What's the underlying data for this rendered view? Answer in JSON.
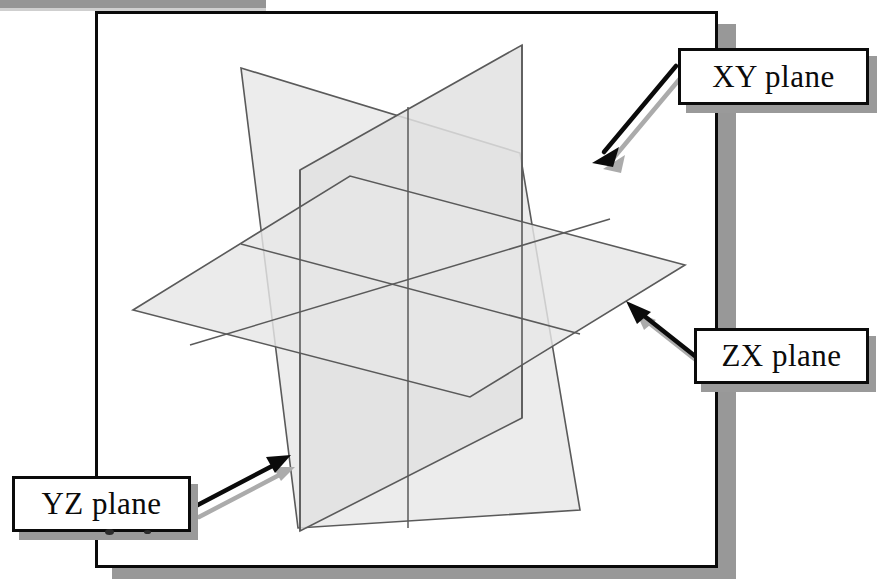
{
  "figure": {
    "background_color": "#ffffff",
    "frame_border_color": "#0a0a0a",
    "frame_shadow_color": "#989898",
    "plane_fill_light": "#ededed",
    "plane_fill_mid": "#e2e2e2",
    "plane_fill_dark": "#d8d8d8",
    "plane_edge_color": "#5a5a5a",
    "arrow_color": "#0b0b0b",
    "arrow_shadow_color": "#a8a8a8"
  },
  "labels": {
    "xy": "XY plane",
    "zx": "ZX plane",
    "yz": "YZ plane"
  },
  "chart_data": {
    "type": "diagram",
    "origin": {
      "x": 408,
      "y": 287
    },
    "planes": [
      {
        "name": "YZ plane",
        "orientation": "vertical-left-facing",
        "fill": "#e9e9e9",
        "corners": [
          {
            "x": 241,
            "y": 68
          },
          {
            "x": 520,
            "y": 153
          },
          {
            "x": 580,
            "y": 510
          },
          {
            "x": 298,
            "y": 528
          }
        ]
      },
      {
        "name": "XY plane",
        "orientation": "vertical-right-facing",
        "fill": "#e4e4e4",
        "corners": [
          {
            "x": 300,
            "y": 170
          },
          {
            "x": 522,
            "y": 45
          },
          {
            "x": 522,
            "y": 418
          },
          {
            "x": 300,
            "y": 531
          }
        ]
      },
      {
        "name": "ZX plane",
        "orientation": "horizontal",
        "fill": "#e6e6e6",
        "corners": [
          {
            "x": 133,
            "y": 310
          },
          {
            "x": 350,
            "y": 176
          },
          {
            "x": 685,
            "y": 265
          },
          {
            "x": 470,
            "y": 397
          }
        ]
      }
    ],
    "annotations": [
      {
        "label": "XY plane",
        "arrow_from": {
          "x": 672,
          "y": 70
        },
        "arrow_to": {
          "x": 592,
          "y": 155
        }
      },
      {
        "label": "ZX plane",
        "arrow_from": {
          "x": 700,
          "y": 360
        },
        "arrow_to": {
          "x": 628,
          "y": 303
        }
      },
      {
        "label": "YZ plane",
        "arrow_from": {
          "x": 193,
          "y": 507
        },
        "arrow_to": {
          "x": 288,
          "y": 457
        }
      }
    ]
  }
}
